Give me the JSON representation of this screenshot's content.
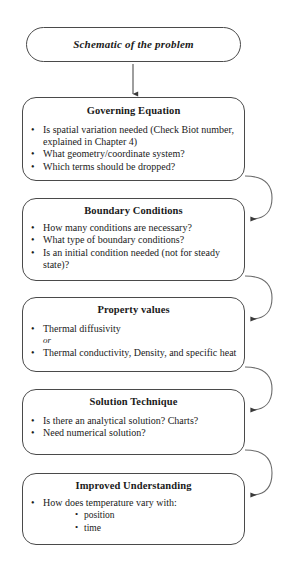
{
  "diagram": {
    "title": "Schematic of the problem",
    "boxes": [
      {
        "id": "schematic",
        "heading": "Schematic of the problem",
        "style": "italic-pill"
      },
      {
        "id": "governing",
        "heading": "Governing Equation",
        "bullets": [
          "Is spatial variation needed (Check Biot number, explained in Chapter 4)",
          "What geometry/coordinate system?",
          "Which terms should be dropped?"
        ]
      },
      {
        "id": "boundary",
        "heading": "Boundary Conditions",
        "bullets": [
          "How many conditions are necessary?",
          "What type of boundary conditions?",
          "Is an initial condition needed (not for steady state)?"
        ]
      },
      {
        "id": "property",
        "heading": "Property values",
        "bullets": [
          "Thermal diffusivity",
          "Thermal conductivity, Density, and specific heat"
        ],
        "separator": "or"
      },
      {
        "id": "solution",
        "heading": "Solution Technique",
        "bullets": [
          "Is there an analytical solution? Charts?",
          "Need numerical solution?"
        ]
      },
      {
        "id": "improved",
        "heading": "Improved Understanding",
        "bullets": [
          "How does temperature vary with:"
        ],
        "subbullets": [
          "position",
          "time"
        ]
      }
    ],
    "glyphs": {
      "bullet": "•",
      "subbullet": "•"
    },
    "connectors": {
      "down_arrow_count": 1,
      "feedback_arrow_count": 4
    },
    "colors": {
      "line": "#4a4a4a",
      "text": "#1a1a1a",
      "background": "#ffffff"
    }
  }
}
